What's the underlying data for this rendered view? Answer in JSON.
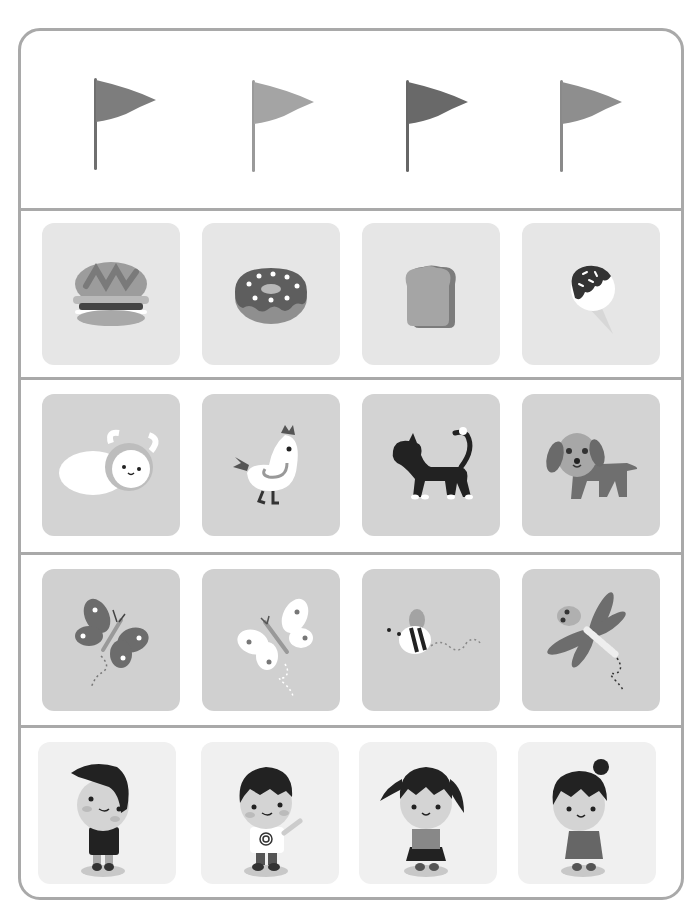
{
  "worksheet": {
    "rows": [
      {
        "id": "flags",
        "items": [
          {
            "label": "Flag 1",
            "icon": "flag-icon",
            "color": "#7d7d7d"
          },
          {
            "label": "Flag 2",
            "icon": "flag-icon",
            "color": "#a4a4a4"
          },
          {
            "label": "Flag 3",
            "icon": "flag-icon",
            "color": "#696969"
          },
          {
            "label": "Flag 4",
            "icon": "flag-icon",
            "color": "#8e8e8e"
          }
        ]
      },
      {
        "id": "food",
        "tile_color": "#e6e6e6",
        "items": [
          {
            "label": "Hamburger",
            "icon": "hamburger-icon"
          },
          {
            "label": "Donut",
            "icon": "donut-icon"
          },
          {
            "label": "Bread",
            "icon": "bread-icon"
          },
          {
            "label": "Ice cream",
            "icon": "ice-cream-icon"
          }
        ]
      },
      {
        "id": "animals",
        "tile_color": "#d3d3d3",
        "items": [
          {
            "label": "Sheep",
            "icon": "sheep-icon"
          },
          {
            "label": "Chicken",
            "icon": "chicken-icon"
          },
          {
            "label": "Cat",
            "icon": "cat-icon"
          },
          {
            "label": "Dog",
            "icon": "dog-icon"
          }
        ]
      },
      {
        "id": "insects",
        "tile_color": "#d0d0d0",
        "items": [
          {
            "label": "Butterfly",
            "icon": "butterfly-icon"
          },
          {
            "label": "White butterfly",
            "icon": "butterfly-icon"
          },
          {
            "label": "Bee",
            "icon": "bee-icon"
          },
          {
            "label": "Dragonfly",
            "icon": "dragonfly-icon"
          }
        ]
      },
      {
        "id": "children",
        "tile_color": "#f0f0f0",
        "items": [
          {
            "label": "Boy",
            "icon": "boy-icon"
          },
          {
            "label": "Boy with spiral shirt",
            "icon": "boy-icon"
          },
          {
            "label": "Girl with pigtails",
            "icon": "girl-icon"
          },
          {
            "label": "Girl with bun",
            "icon": "girl-icon"
          }
        ]
      }
    ]
  }
}
